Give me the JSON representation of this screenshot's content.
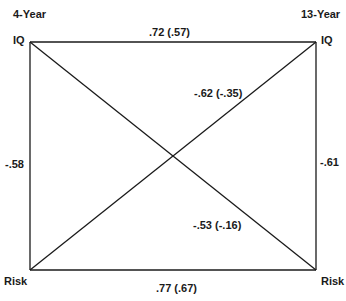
{
  "diagram": {
    "left_wave_label": "4-Year",
    "right_wave_label": "13-Year",
    "nodes": {
      "iq_4yr": "IQ",
      "iq_13yr": "IQ",
      "risk_4yr": "Risk",
      "risk_13yr": "Risk"
    },
    "paths": {
      "iq_stability": ".72 (.57)",
      "risk_stability": ".77 (.67)",
      "iq_risk_4yr": "-.58",
      "iq_risk_13yr": "-.61",
      "risk4_to_iq13": "-.62 (-.35)",
      "iq4_to_risk13": "-.53 (-.16)"
    },
    "line_color": "#1a1a1a"
  }
}
